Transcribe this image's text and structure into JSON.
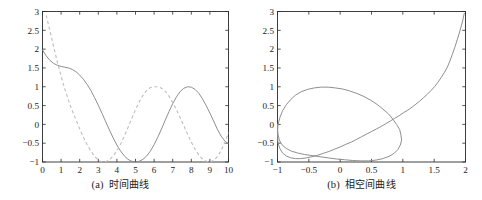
{
  "figure": {
    "panels": [
      {
        "id": "panel-a",
        "caption_label": "(a)",
        "caption_text": "时间曲线",
        "chart_index": 0
      },
      {
        "id": "panel-b",
        "caption_label": "(b)",
        "caption_text": "相空间曲线",
        "chart_index": 1
      }
    ]
  },
  "colors": {
    "solid_curve": "#8f8f8f",
    "dashed_curve": "#bdbdbd",
    "axis": "#2b2b2b",
    "text": "#1c1c1c",
    "background": "#ffffff"
  },
  "chart_data": [
    {
      "type": "line",
      "title": "(a) 时间曲线",
      "xlabel": "",
      "ylabel": "",
      "xlim": [
        0,
        10
      ],
      "ylim": [
        -1,
        3
      ],
      "grid": false,
      "legend": null,
      "xticks": [
        "0",
        "1",
        "2",
        "3",
        "4",
        "5",
        "6",
        "7",
        "8",
        "9",
        "10"
      ],
      "yticks": [
        "-1",
        "-0.5",
        "0",
        "0.5",
        "1",
        "1.5",
        "2",
        "2.5",
        "3"
      ],
      "xtick_values": [
        0,
        1,
        2,
        3,
        4,
        5,
        6,
        7,
        8,
        9,
        10
      ],
      "ytick_values": [
        -1,
        -0.5,
        0,
        0.5,
        1,
        1.5,
        2,
        2.5,
        3
      ],
      "series": [
        {
          "name": "x(t)",
          "style": "solid",
          "color": "#8f8f8f",
          "x": [
            0,
            0.2,
            0.4,
            0.6,
            0.8,
            1.0,
            1.2,
            1.4,
            1.6,
            1.8,
            2.0,
            2.2,
            2.4,
            2.6,
            2.8,
            3.0,
            3.2,
            3.4,
            3.6,
            3.8,
            4.0,
            4.2,
            4.4,
            4.6,
            4.8,
            5.0,
            5.2,
            5.4,
            5.6,
            5.8,
            6.0,
            6.2,
            6.4,
            6.6,
            6.8,
            7.0,
            7.2,
            7.4,
            7.6,
            7.8,
            8.0,
            8.2,
            8.4,
            8.6,
            8.8,
            9.0,
            9.2,
            9.4,
            9.6,
            9.8,
            10.0
          ],
          "y": [
            1.98,
            1.82,
            1.7,
            1.62,
            1.57,
            1.54,
            1.52,
            1.5,
            1.46,
            1.4,
            1.31,
            1.2,
            1.06,
            0.9,
            0.71,
            0.51,
            0.29,
            0.07,
            -0.15,
            -0.36,
            -0.55,
            -0.71,
            -0.84,
            -0.93,
            -0.98,
            -1.0,
            -0.98,
            -0.93,
            -0.84,
            -0.71,
            -0.54,
            -0.34,
            -0.12,
            0.11,
            0.34,
            0.55,
            0.73,
            0.87,
            0.96,
            1.0,
            0.99,
            0.93,
            0.83,
            0.68,
            0.5,
            0.3,
            0.09,
            -0.13,
            -0.31,
            -0.44,
            -0.52
          ]
        },
        {
          "name": "dx/dt",
          "style": "dashed",
          "color": "#bdbdbd",
          "x": [
            0,
            0.2,
            0.4,
            0.6,
            0.8,
            1.0,
            1.2,
            1.4,
            1.6,
            1.8,
            2.0,
            2.2,
            2.4,
            2.6,
            2.8,
            3.0,
            3.2,
            3.4,
            3.6,
            3.8,
            4.0,
            4.2,
            4.4,
            4.6,
            4.8,
            5.0,
            5.2,
            5.4,
            5.6,
            5.8,
            6.0,
            6.2,
            6.4,
            6.6,
            6.8,
            7.0,
            7.2,
            7.4,
            7.6,
            7.8,
            8.0,
            8.2,
            8.4,
            8.6,
            8.8,
            9.0,
            9.2,
            9.4,
            9.6,
            9.8,
            10.0
          ],
          "y": [
            3.3,
            2.9,
            2.48,
            2.06,
            1.66,
            1.28,
            0.94,
            0.64,
            0.36,
            0.12,
            -0.12,
            -0.34,
            -0.54,
            -0.71,
            -0.85,
            -0.95,
            -1.0,
            -0.99,
            -0.94,
            -0.84,
            -0.7,
            -0.52,
            -0.31,
            -0.08,
            0.16,
            0.39,
            0.6,
            0.77,
            0.9,
            0.98,
            1.0,
            1.0,
            0.96,
            0.88,
            0.75,
            0.58,
            0.39,
            0.18,
            -0.04,
            -0.26,
            -0.47,
            -0.66,
            -0.81,
            -0.92,
            -0.98,
            -1.0,
            -0.96,
            -0.86,
            -0.7,
            -0.48,
            -0.22
          ]
        }
      ]
    },
    {
      "type": "line",
      "title": "(b) 相空间曲线",
      "xlabel": "",
      "ylabel": "",
      "xlim": [
        -1,
        2
      ],
      "ylim": [
        -1,
        3
      ],
      "grid": false,
      "legend": null,
      "xticks": [
        "-1",
        "-0.5",
        "0",
        "0.5",
        "1",
        "1.5",
        "2"
      ],
      "yticks": [
        "-1",
        "-0.5",
        "0",
        "0.5",
        "1",
        "1.5",
        "2",
        "2.5",
        "3"
      ],
      "xtick_values": [
        -1,
        -0.5,
        0,
        0.5,
        1,
        1.5,
        2
      ],
      "ytick_values": [
        -1,
        -0.5,
        0,
        0.5,
        1,
        1.5,
        2,
        2.5,
        3
      ],
      "series": [
        {
          "name": "phase trajectory",
          "style": "solid",
          "color": "#8f8f8f",
          "description": "Trajectory starting near (1.98, 2.95) spiraling inward onto a near-unit limit cycle centred at the origin.",
          "points": [
            [
              1.98,
              2.95
            ],
            [
              1.95,
              2.72
            ],
            [
              1.91,
              2.48
            ],
            [
              1.87,
              2.26
            ],
            [
              1.83,
              2.05
            ],
            [
              1.79,
              1.86
            ],
            [
              1.75,
              1.68
            ],
            [
              1.71,
              1.52
            ],
            [
              1.66,
              1.37
            ],
            [
              1.61,
              1.24
            ],
            [
              1.56,
              1.12
            ],
            [
              1.51,
              1.01
            ],
            [
              1.45,
              0.9
            ],
            [
              1.39,
              0.8
            ],
            [
              1.33,
              0.71
            ],
            [
              1.27,
              0.62
            ],
            [
              1.21,
              0.54
            ],
            [
              1.15,
              0.46
            ],
            [
              1.08,
              0.38
            ],
            [
              1.01,
              0.31
            ],
            [
              0.94,
              0.23
            ],
            [
              0.87,
              0.16
            ],
            [
              0.8,
              0.09
            ],
            [
              0.73,
              0.02
            ],
            [
              0.66,
              -0.05
            ],
            [
              0.58,
              -0.12
            ],
            [
              0.5,
              -0.19
            ],
            [
              0.42,
              -0.26
            ],
            [
              0.34,
              -0.33
            ],
            [
              0.26,
              -0.4
            ],
            [
              0.18,
              -0.47
            ],
            [
              0.09,
              -0.53
            ],
            [
              0.0,
              -0.6
            ],
            [
              -0.09,
              -0.66
            ],
            [
              -0.18,
              -0.72
            ],
            [
              -0.27,
              -0.77
            ],
            [
              -0.36,
              -0.82
            ],
            [
              -0.45,
              -0.86
            ],
            [
              -0.54,
              -0.89
            ],
            [
              -0.63,
              -0.91
            ],
            [
              -0.71,
              -0.91
            ],
            [
              -0.79,
              -0.89
            ],
            [
              -0.86,
              -0.84
            ],
            [
              -0.92,
              -0.76
            ],
            [
              -0.96,
              -0.65
            ],
            [
              -0.99,
              -0.51
            ],
            [
              -1.0,
              -0.35
            ],
            [
              -1.0,
              -0.17
            ],
            [
              -0.99,
              0.01
            ],
            [
              -0.96,
              0.19
            ],
            [
              -0.92,
              0.36
            ],
            [
              -0.86,
              0.52
            ],
            [
              -0.79,
              0.66
            ],
            [
              -0.71,
              0.78
            ],
            [
              -0.62,
              0.87
            ],
            [
              -0.52,
              0.93
            ],
            [
              -0.41,
              0.97
            ],
            [
              -0.3,
              0.99
            ],
            [
              -0.19,
              0.99
            ],
            [
              -0.08,
              0.97
            ],
            [
              0.04,
              0.94
            ],
            [
              0.15,
              0.89
            ],
            [
              0.27,
              0.82
            ],
            [
              0.38,
              0.74
            ],
            [
              0.49,
              0.64
            ],
            [
              0.59,
              0.53
            ],
            [
              0.68,
              0.41
            ],
            [
              0.77,
              0.28
            ],
            [
              0.84,
              0.14
            ],
            [
              0.9,
              0.0
            ],
            [
              0.95,
              -0.14
            ],
            [
              0.97,
              -0.28
            ],
            [
              0.98,
              -0.42
            ],
            [
              0.96,
              -0.55
            ],
            [
              0.92,
              -0.67
            ],
            [
              0.86,
              -0.77
            ],
            [
              0.78,
              -0.85
            ],
            [
              0.68,
              -0.91
            ],
            [
              0.57,
              -0.95
            ],
            [
              0.45,
              -0.97
            ],
            [
              0.33,
              -0.97
            ],
            [
              0.2,
              -0.96
            ],
            [
              0.07,
              -0.94
            ],
            [
              -0.06,
              -0.92
            ],
            [
              -0.19,
              -0.89
            ],
            [
              -0.32,
              -0.86
            ],
            [
              -0.45,
              -0.83
            ],
            [
              -0.57,
              -0.8
            ],
            [
              -0.68,
              -0.76
            ],
            [
              -0.78,
              -0.71
            ],
            [
              -0.86,
              -0.64
            ],
            [
              -0.93,
              -0.54
            ],
            [
              -0.97,
              -0.42
            ],
            [
              -0.99,
              -0.28
            ],
            [
              -1.0,
              -0.13
            ],
            [
              -1.0,
              0.0
            ]
          ]
        }
      ]
    }
  ]
}
